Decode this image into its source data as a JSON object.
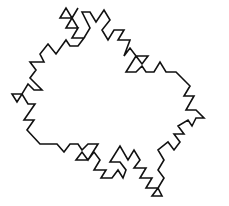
{
  "figure": {
    "background": "#ffffff",
    "stroke_color": "#111111",
    "symmetry": "6-fold rotational"
  }
}
